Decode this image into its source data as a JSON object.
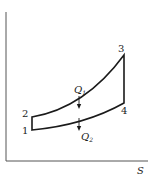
{
  "diagram": {
    "type": "T-S thermodynamic cycle",
    "axes": {
      "x_label": "S",
      "y_label": ""
    },
    "points": [
      {
        "id": "1",
        "label": "1"
      },
      {
        "id": "2",
        "label": "2"
      },
      {
        "id": "3",
        "label": "3"
      },
      {
        "id": "4",
        "label": "4"
      }
    ],
    "heat": {
      "q_in": {
        "symbol": "Q",
        "sub": "1"
      },
      "q_out": {
        "symbol": "Q",
        "sub": "2"
      }
    },
    "colors": {
      "line": "#1a1a1a",
      "axis": "#555555",
      "background": "#ffffff"
    }
  }
}
